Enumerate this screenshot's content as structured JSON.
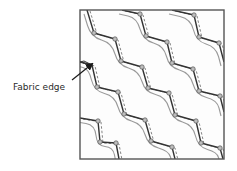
{
  "figure": {
    "annotation": {
      "label": "Fabric edge",
      "arrow_from": [
        72,
        80
      ],
      "arrow_to": [
        92,
        64
      ]
    },
    "panel": {
      "x": 80,
      "y": 10,
      "width": 144,
      "height": 149,
      "border_color": "#555555",
      "background": "#fdfdfd"
    },
    "colors": {
      "stitch_line": "#333333",
      "guide_line": "#9a9a9a",
      "dashed_line": "#666666",
      "vertex_fill": "#bdbdbd",
      "vertex_stroke": "#555555",
      "label_text": "#2a2a2a"
    },
    "bands": [
      {
        "name": "band-a",
        "points": [
          [
            87,
            10
          ],
          [
            94,
            33
          ],
          [
            115,
            39
          ],
          [
            121,
            61
          ],
          [
            142,
            67
          ],
          [
            148,
            88
          ],
          [
            169,
            93
          ],
          [
            175,
            115
          ],
          [
            196,
            121
          ],
          [
            201,
            143
          ],
          [
            220,
            148
          ],
          [
            223,
            159
          ]
        ],
        "vertices": [
          [
            94,
            33
          ],
          [
            115,
            39
          ],
          [
            121,
            61
          ],
          [
            142,
            67
          ],
          [
            148,
            88
          ],
          [
            169,
            93
          ],
          [
            175,
            115
          ],
          [
            196,
            121
          ],
          [
            201,
            143
          ],
          [
            220,
            148
          ]
        ]
      },
      {
        "name": "band-b",
        "points": [
          [
            122,
            10
          ],
          [
            140,
            14
          ],
          [
            146,
            36
          ],
          [
            167,
            42
          ],
          [
            172,
            63
          ],
          [
            193,
            69
          ],
          [
            199,
            91
          ],
          [
            220,
            96
          ],
          [
            224,
            112
          ]
        ],
        "vertices": [
          [
            140,
            14
          ],
          [
            146,
            36
          ],
          [
            167,
            42
          ],
          [
            172,
            63
          ],
          [
            193,
            69
          ],
          [
            199,
            91
          ],
          [
            220,
            96
          ]
        ]
      },
      {
        "name": "band-c",
        "points": [
          [
            172,
            10
          ],
          [
            194,
            15
          ],
          [
            199,
            37
          ],
          [
            219,
            43
          ],
          [
            224,
            62
          ]
        ],
        "vertices": [
          [
            194,
            15
          ],
          [
            199,
            37
          ],
          [
            219,
            43
          ]
        ]
      },
      {
        "name": "band-d",
        "points": [
          [
            80,
            62
          ],
          [
            92,
            65
          ],
          [
            97,
            87
          ],
          [
            118,
            92
          ],
          [
            124,
            114
          ],
          [
            145,
            120
          ],
          [
            151,
            141
          ],
          [
            172,
            147
          ],
          [
            175,
            159
          ]
        ],
        "vertices": [
          [
            97,
            87
          ],
          [
            118,
            92
          ],
          [
            124,
            114
          ],
          [
            145,
            120
          ],
          [
            151,
            141
          ],
          [
            172,
            147
          ]
        ]
      },
      {
        "name": "band-e",
        "points": [
          [
            80,
            118
          ],
          [
            98,
            121
          ],
          [
            100,
            142
          ],
          [
            116,
            143
          ],
          [
            119,
            159
          ]
        ],
        "vertices": [
          [
            98,
            121
          ],
          [
            100,
            142
          ],
          [
            116,
            143
          ]
        ]
      }
    ]
  }
}
